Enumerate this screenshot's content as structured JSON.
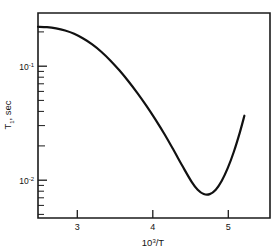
{
  "chart_data": {
    "type": "line",
    "title": "",
    "xlabel": "10³/T",
    "ylabel": "T₁, sec",
    "xlabel_mantissa": "10",
    "xlabel_exponent": "3",
    "xlabel_suffix": "/T",
    "ylabel_base": "T",
    "ylabel_sub": "1",
    "ylabel_suffix": ", sec",
    "xscale": "linear",
    "yscale": "log",
    "xlim": [
      2.48,
      5.56
    ],
    "ylim": [
      0.0041,
      0.31
    ],
    "grid": false,
    "legend": false,
    "legend_position": "none",
    "xticks": [
      3,
      4,
      5
    ],
    "xtick_labels": [
      "3",
      "4",
      "5"
    ],
    "yticks": [
      0.1,
      0.01
    ],
    "ytick_labels": [
      "10⁻¹",
      "10⁻²"
    ],
    "ytick_mantissa": "10",
    "ytick_exponents": [
      "-1",
      "-2"
    ],
    "yminor_ticks": [
      0.2,
      0.09,
      0.08,
      0.07,
      0.06,
      0.05,
      0.04,
      0.03,
      0.02,
      0.009,
      0.008,
      0.007,
      0.006,
      0.005
    ],
    "series": [
      {
        "name": "T1 relaxation",
        "x": [
          2.48,
          2.6,
          2.72,
          2.84,
          2.96,
          3.08,
          3.2,
          3.32,
          3.44,
          3.56,
          3.68,
          3.8,
          3.92,
          4.04,
          4.16,
          4.28,
          4.4,
          4.52,
          4.6,
          4.68,
          4.76,
          4.84,
          4.92,
          5.0,
          5.08,
          5.16,
          5.22
        ],
        "y": [
          0.232,
          0.23,
          0.224,
          0.214,
          0.2,
          0.181,
          0.16,
          0.137,
          0.114,
          0.0925,
          0.0735,
          0.0572,
          0.0437,
          0.0327,
          0.024,
          0.0172,
          0.0122,
          0.0088,
          0.00745,
          0.0068,
          0.00678,
          0.00745,
          0.009,
          0.0118,
          0.0166,
          0.025,
          0.0355
        ]
      }
    ],
    "annotations": []
  },
  "figure": {
    "background_color": "#ffffff",
    "axis_color": "#1b1b1b",
    "curve_color": "#111111",
    "frame": {
      "left": 38,
      "right": 270,
      "top": 13,
      "bottom": 218
    }
  }
}
